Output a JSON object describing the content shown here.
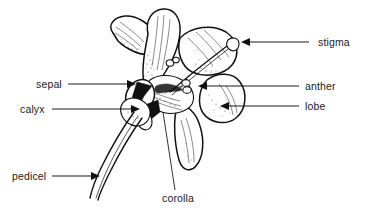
{
  "figure": {
    "style": "black-and-white-line-drawing",
    "background_color": "#ffffff",
    "ink_color": "#111111",
    "text_color": "#1a1a1a"
  },
  "labels": [
    {
      "id": "stigma",
      "text": "stigma",
      "side": "right",
      "text_x": 318,
      "text_y": 46,
      "leader": {
        "x1": 309,
        "y1": 42,
        "x2": 247,
        "y2": 42
      },
      "arrow": {
        "x": 241,
        "y": 42,
        "direction": "left"
      }
    },
    {
      "id": "anther",
      "text": "anther",
      "side": "right",
      "text_x": 305,
      "text_y": 90,
      "leader": {
        "x1": 299,
        "y1": 86,
        "x2": 204,
        "y2": 86
      },
      "arrow": {
        "x": 198,
        "y": 86,
        "direction": "left"
      }
    },
    {
      "id": "lobe",
      "text": "lobe",
      "side": "right",
      "text_x": 305,
      "text_y": 110,
      "leader": {
        "x1": 299,
        "y1": 106,
        "x2": 226,
        "y2": 106
      },
      "arrow": {
        "x": 220,
        "y": 106,
        "direction": "left"
      }
    },
    {
      "id": "sepal",
      "text": "sepal",
      "side": "left",
      "text_x": 36,
      "text_y": 88,
      "leader": {
        "x1": 68,
        "y1": 84,
        "x2": 130,
        "y2": 84
      },
      "arrow": {
        "x": 136,
        "y": 84,
        "direction": "right"
      }
    },
    {
      "id": "calyx",
      "text": "calyx",
      "side": "left",
      "text_x": 20,
      "text_y": 113,
      "leader": {
        "x1": 52,
        "y1": 109,
        "x2": 134,
        "y2": 109
      },
      "arrow": {
        "x": 140,
        "y": 109,
        "direction": "right"
      }
    },
    {
      "id": "pedicel",
      "text": "pedicel",
      "side": "left",
      "text_x": 12,
      "text_y": 180,
      "leader": {
        "x1": 52,
        "y1": 176,
        "x2": 94,
        "y2": 176
      },
      "arrow": {
        "x": 100,
        "y": 176,
        "direction": "right"
      }
    },
    {
      "id": "corolla",
      "text": "corolla",
      "side": "bottom",
      "text_x": 162,
      "text_y": 202,
      "leader": {
        "x1": 175,
        "y1": 190,
        "x2": 163,
        "y2": 112
      },
      "arrow": null
    }
  ],
  "parts": [
    {
      "id": "upper-petal-left",
      "name": "upper lateral petal"
    },
    {
      "id": "upper-petal-center",
      "name": "upper central petal"
    },
    {
      "id": "upper-petal-right",
      "name": "upper right petal"
    },
    {
      "id": "lobe-right",
      "name": "rounded corolla lobe"
    },
    {
      "id": "lower-petal",
      "name": "drooping lower petal"
    },
    {
      "id": "style-stigma",
      "name": "style with club-shaped stigma"
    },
    {
      "id": "anther-pair",
      "name": "paired anthers in throat"
    },
    {
      "id": "sepal-calyx",
      "name": "pointed sepals forming calyx"
    },
    {
      "id": "pedicel-stem",
      "name": "curving pedicel stem"
    }
  ]
}
